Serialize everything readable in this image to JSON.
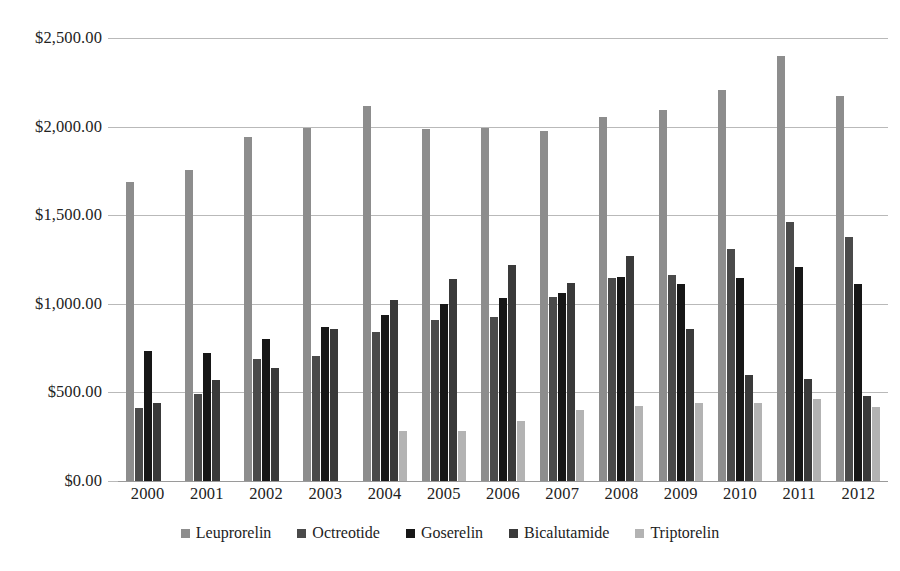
{
  "chart_data": {
    "type": "bar",
    "title": "",
    "xlabel": "",
    "ylabel": "",
    "grid": true,
    "legend_position": "bottom",
    "ylim": [
      0,
      2500
    ],
    "ytick_values": [
      2500,
      2000,
      1500,
      1000,
      500,
      0
    ],
    "ytick_labels": [
      "$2,500.00",
      "$2,000.00",
      "$1,500.00",
      "$1,000.00",
      "$500.00",
      "$0.00"
    ],
    "categories": [
      "2000",
      "2001",
      "2002",
      "2003",
      "2004",
      "2005",
      "2006",
      "2007",
      "2008",
      "2009",
      "2010",
      "2011",
      "2012"
    ],
    "series": [
      {
        "name": "Leuprorelin",
        "color": "#8d8d8d",
        "values": [
          1690,
          1755,
          1940,
          1990,
          2115,
          1985,
          1995,
          1975,
          2055,
          2095,
          2205,
          2400,
          2170
        ]
      },
      {
        "name": "Octreotide",
        "color": "#4a4a4a",
        "values": [
          410,
          490,
          690,
          705,
          840,
          910,
          925,
          1040,
          1145,
          1165,
          1310,
          1460,
          1375
        ]
      },
      {
        "name": "Goserelin",
        "color": "#171717",
        "values": [
          735,
          725,
          800,
          870,
          935,
          1000,
          1030,
          1060,
          1150,
          1110,
          1145,
          1210,
          1110
        ]
      },
      {
        "name": "Bicalutamide",
        "color": "#3a3a3a",
        "values": [
          440,
          570,
          640,
          860,
          1020,
          1140,
          1220,
          1115,
          1270,
          860,
          600,
          575,
          480
        ]
      },
      {
        "name": "Triptorelin",
        "color": "#b3b3b3",
        "values": [
          null,
          null,
          null,
          null,
          280,
          280,
          340,
          400,
          425,
          440,
          440,
          465,
          420
        ]
      }
    ]
  }
}
